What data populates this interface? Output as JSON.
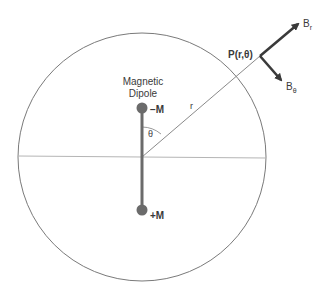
{
  "diagram": {
    "dipole_label_line1": "Magnetic",
    "dipole_label_line2": "Dipole",
    "neg_pole_label": "−M",
    "pos_pole_label": "+M",
    "angle_label": "θ",
    "radius_label": "r",
    "point_label": "P(r,θ)",
    "br_label_main": "B",
    "br_label_sub": "r",
    "btheta_label_main": "B",
    "btheta_label_sub": "θ",
    "colors": {
      "circle": "#7a7a7a",
      "equator": "#b5b5b5",
      "dipole": "#6b6b6b",
      "arrow": "#3a3a3a",
      "text": "#3a3a3a"
    }
  }
}
